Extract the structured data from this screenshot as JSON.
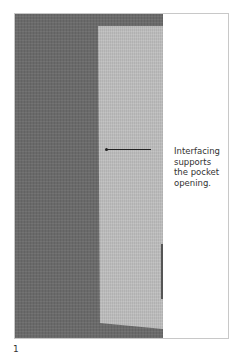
{
  "figure": {
    "number": "1",
    "callout_lines": [
      "Interfacing",
      "supports",
      "the pocket",
      "opening."
    ],
    "colors": {
      "fabric": "#6a6a6a",
      "interfacing": "#bcbcbc",
      "background": "#ffffff"
    }
  }
}
